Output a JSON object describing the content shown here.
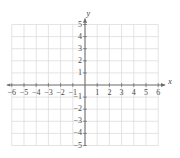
{
  "figure": {
    "background_color": "#ffffff"
  },
  "chart_data": {
    "type": "scatter",
    "title": "",
    "subtitle": "",
    "xlabel": "x",
    "ylabel": "y",
    "xlim": [
      -6,
      6
    ],
    "ylim": [
      -5,
      5
    ],
    "xticks": [
      -6,
      -5,
      -4,
      -3,
      -2,
      -1,
      1,
      2,
      3,
      4,
      5,
      6
    ],
    "yticks": [
      5,
      4,
      3,
      2,
      1,
      -1,
      -2,
      -3,
      -4,
      -5
    ],
    "xtick_labels": [
      "−6",
      "−5",
      "−4",
      "−3",
      "−2",
      "−1",
      "1",
      "2",
      "3",
      "4",
      "5",
      "6"
    ],
    "ytick_labels": [
      "5",
      "4",
      "3",
      "2",
      "1",
      "−1",
      "−2",
      "−3",
      "−4",
      "−5"
    ],
    "grid": true,
    "grid_step": 1,
    "legend": false,
    "legend_position": "none",
    "series": [],
    "values": [],
    "x": [],
    "annotations": [],
    "axis_arrows": {
      "x_positive": true,
      "x_negative": true,
      "y_positive": true,
      "y_negative": false
    },
    "colors": {
      "grid": "#d8d8d8",
      "axis": "#6b6b6b",
      "tick_label": "#4a4a4a",
      "axis_label": "#3a3a3a",
      "background": "#ffffff"
    }
  },
  "geometry": {
    "origin_x": 85,
    "origin_y": 85,
    "unit_x": 12.2,
    "unit_y": 12.1,
    "grid_left": 11.8,
    "grid_right": 158.2,
    "grid_top": 24.5,
    "grid_bottom": 145.5
  },
  "labels": {
    "x_axis_name": "x",
    "y_axis_name": "y",
    "x_ticks": [
      {
        "value": -6,
        "text": "−6",
        "px": 11.8
      },
      {
        "value": -5,
        "text": "−5",
        "px": 24.0
      },
      {
        "value": -4,
        "text": "−4",
        "px": 36.2
      },
      {
        "value": -3,
        "text": "−3",
        "px": 48.4
      },
      {
        "value": -2,
        "text": "−2",
        "px": 60.6
      },
      {
        "value": -1,
        "text": "−1",
        "px": 72.8
      },
      {
        "value": 1,
        "text": "1",
        "px": 97.2
      },
      {
        "value": 2,
        "text": "2",
        "px": 109.4
      },
      {
        "value": 3,
        "text": "3",
        "px": 121.6
      },
      {
        "value": 4,
        "text": "4",
        "px": 133.8
      },
      {
        "value": 5,
        "text": "5",
        "px": 146.0
      },
      {
        "value": 6,
        "text": "6",
        "px": 158.2
      }
    ],
    "y_ticks": [
      {
        "value": 5,
        "text": "5",
        "px": 24.5
      },
      {
        "value": 4,
        "text": "4",
        "px": 36.6
      },
      {
        "value": 3,
        "text": "3",
        "px": 48.7
      },
      {
        "value": 2,
        "text": "2",
        "px": 60.8
      },
      {
        "value": 1,
        "text": "1",
        "px": 72.9
      },
      {
        "value": -1,
        "text": "−1",
        "px": 97.1
      },
      {
        "value": -2,
        "text": "−2",
        "px": 109.2
      },
      {
        "value": -3,
        "text": "−3",
        "px": 121.3
      },
      {
        "value": -4,
        "text": "−4",
        "px": 133.4
      },
      {
        "value": -5,
        "text": "−5",
        "px": 145.5
      }
    ]
  }
}
